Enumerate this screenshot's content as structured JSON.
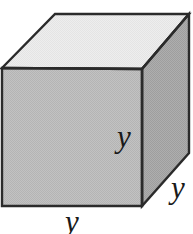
{
  "figure": {
    "name": "cube-diagram",
    "shape": "cube",
    "background_color": "#ffffff"
  },
  "faces": {
    "top": {
      "name": "top-face",
      "fill": "#ebebeb",
      "points": "2,68 55,14 189,14 142,69"
    },
    "front": {
      "name": "front-face",
      "fill": "#bdbdbd",
      "points": "2,68 142,69 142,206 2,206"
    },
    "right": {
      "name": "right-face",
      "fill": "#a8a8a8",
      "points": "142,69 189,14 189,153 142,206"
    }
  },
  "edges": {
    "stroke": "#2b2b2b",
    "stroke_width": 2.4
  },
  "labels": {
    "height": "y",
    "depth": "y",
    "width": "y"
  },
  "colors": {
    "top_face": "#ebebeb",
    "front_face": "#bdbdbd",
    "right_face": "#a8a8a8",
    "edge": "#2b2b2b",
    "text": "#1a1a1a",
    "background": "#ffffff"
  }
}
